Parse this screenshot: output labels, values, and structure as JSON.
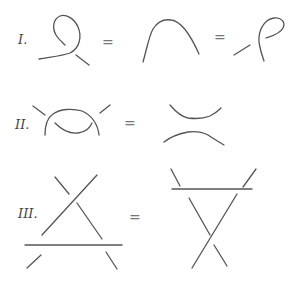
{
  "diagram": {
    "stroke_color": "#555555",
    "moves": [
      {
        "label": "I.",
        "equals": [
          "=",
          "="
        ],
        "parts": [
          "twist-left",
          "arc",
          "twist-right"
        ]
      },
      {
        "label": "II.",
        "equals": [
          "="
        ],
        "parts": [
          "overlap",
          "separated-arcs"
        ]
      },
      {
        "label": "III.",
        "equals": [
          "="
        ],
        "parts": [
          "triangle-below",
          "triangle-above"
        ]
      }
    ]
  }
}
